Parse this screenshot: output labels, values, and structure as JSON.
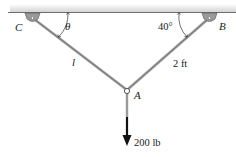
{
  "diagram": {
    "type": "statics-cable-system",
    "supports": {
      "left": {
        "label": "C"
      },
      "right": {
        "label": "B"
      }
    },
    "joint": {
      "label": "A"
    },
    "angles": {
      "left": "θ",
      "right": "40°"
    },
    "members": {
      "CA": {
        "label": "l"
      },
      "BA": {
        "label": "2 ft"
      }
    },
    "load": {
      "label": "200 lb"
    },
    "colors": {
      "ceiling": "#6e6e6e",
      "support": "#9a9a9a",
      "cable": "#8a8a8a",
      "arrow": "#111111",
      "text": "#222222"
    }
  }
}
